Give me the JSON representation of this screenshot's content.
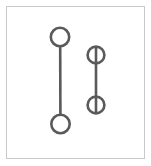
{
  "canvas": {
    "width": 151,
    "height": 166,
    "background_color": "#ffffff"
  },
  "frame": {
    "label": "outer-frame",
    "x": 6.5,
    "y": 6.5,
    "width": 138,
    "height": 152,
    "stroke_color": "#c9c9c9",
    "stroke_width": 1,
    "fill_color": "#ffffff"
  },
  "style": {
    "stroke_color": "#5a5a5a",
    "stroke_width": 2.6,
    "fill_color": "none"
  },
  "chart_data": {
    "type": "diagram",
    "title": "",
    "shapes": [
      {
        "name": "left-dumbbell",
        "connector_style": "tangent",
        "circles": [
          {
            "name": "left-top-circle",
            "cx": 60,
            "cy": 37,
            "r": 9.2
          },
          {
            "name": "left-bottom-circle",
            "cx": 60.5,
            "cy": 124,
            "r": 9.2
          }
        ],
        "connector": {
          "x1": 60.2,
          "y1": 46.2,
          "x2": 60.4,
          "y2": 114.8
        }
      },
      {
        "name": "right-dumbbell",
        "connector_style": "through",
        "circles": [
          {
            "name": "right-top-circle",
            "cx": 96,
            "cy": 55,
            "r": 8.4
          },
          {
            "name": "right-bottom-circle",
            "cx": 96,
            "cy": 105,
            "r": 8.4
          }
        ],
        "connector": {
          "x1": 96,
          "y1": 46.6,
          "x2": 96,
          "y2": 113.4
        }
      }
    ],
    "xlabel": "",
    "ylabel": "",
    "legend": [],
    "grid": false
  }
}
